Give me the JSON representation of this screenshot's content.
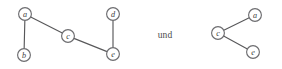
{
  "figure": {
    "background_color": "#ffffff",
    "conjunction": {
      "text": "und",
      "x": 165,
      "y": 34.5
    },
    "node_style": {
      "radius": 6.4,
      "fill": "#ffffff",
      "stroke": "#6d6d70"
    },
    "edge_style": {
      "stroke": "#58585a",
      "width": 1.15
    },
    "graphs": [
      {
        "name": "left-graph",
        "nodes": [
          {
            "id": "a",
            "label": "a",
            "x": 25,
            "y": 14
          },
          {
            "id": "b",
            "label": "b",
            "x": 24,
            "y": 55
          },
          {
            "id": "c",
            "label": "c",
            "x": 68,
            "y": 36
          },
          {
            "id": "d",
            "label": "d",
            "x": 113,
            "y": 14
          },
          {
            "id": "e",
            "label": "e",
            "x": 113,
            "y": 54
          }
        ],
        "edges": [
          {
            "from": "a",
            "to": "b"
          },
          {
            "from": "a",
            "to": "c"
          },
          {
            "from": "c",
            "to": "e"
          },
          {
            "from": "d",
            "to": "e"
          }
        ]
      },
      {
        "name": "right-graph",
        "nodes": [
          {
            "id": "a",
            "label": "a",
            "x": 255,
            "y": 15
          },
          {
            "id": "c",
            "label": "c",
            "x": 218,
            "y": 33
          },
          {
            "id": "e",
            "label": "e",
            "x": 253,
            "y": 52
          }
        ],
        "edges": [
          {
            "from": "c",
            "to": "a"
          },
          {
            "from": "c",
            "to": "e"
          }
        ]
      }
    ]
  }
}
